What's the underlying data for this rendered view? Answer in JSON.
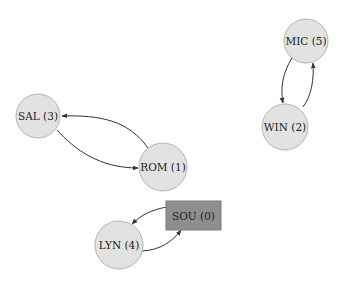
{
  "diagram": {
    "type": "directed-graph",
    "nodes": [
      {
        "id": "SAL",
        "label": "SAL (3)",
        "shape": "circle"
      },
      {
        "id": "ROM",
        "label": "ROM (1)",
        "shape": "circle"
      },
      {
        "id": "MIC",
        "label": "MIC (5)",
        "shape": "circle"
      },
      {
        "id": "WIN",
        "label": "WIN (2)",
        "shape": "circle"
      },
      {
        "id": "LYN",
        "label": "LYN (4)",
        "shape": "circle"
      },
      {
        "id": "SOU",
        "label": "SOU (0)",
        "shape": "box",
        "highlighted": true
      }
    ],
    "edges": [
      {
        "from": "ROM",
        "to": "SAL"
      },
      {
        "from": "SAL",
        "to": "ROM"
      },
      {
        "from": "MIC",
        "to": "WIN"
      },
      {
        "from": "WIN",
        "to": "MIC"
      },
      {
        "from": "SOU",
        "to": "LYN"
      },
      {
        "from": "LYN",
        "to": "SOU"
      }
    ],
    "colors": {
      "node_fill": "#e2e2e2",
      "node_stroke": "#b4b4b4",
      "highlight_fill": "#8e8e8e",
      "edge": "#333333",
      "text": "#222222"
    }
  }
}
